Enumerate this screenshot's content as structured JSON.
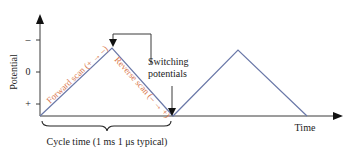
{
  "diagram": {
    "y_axis": {
      "label": "Potential",
      "ticks": [
        "–",
        "0",
        "+"
      ]
    },
    "x_axis": {
      "label": "Time"
    },
    "annotations": {
      "forward_scan": "Forward scan (+ → –)",
      "reverse_scan": "Reverse scan (– → +)",
      "switching_line1": "Switching",
      "switching_line2": "potentials",
      "cycle_time": "Cycle time (1 ms 1 μs typical)"
    },
    "colors": {
      "axis": "#3a3a3a",
      "waveform": "#6a78a8",
      "scan_label": "#d9784e",
      "text": "#222222"
    }
  }
}
